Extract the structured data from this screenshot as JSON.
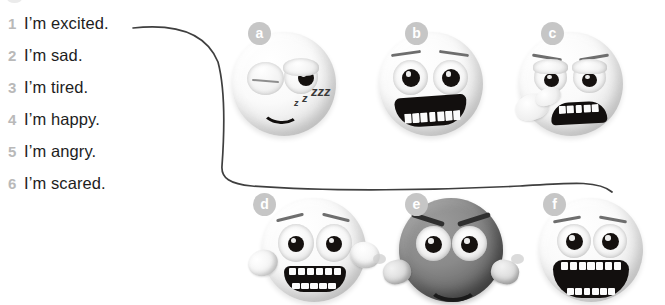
{
  "exercise": {
    "list": [
      {
        "num": "1",
        "text": "I’m excited."
      },
      {
        "num": "2",
        "text": "I’m sad."
      },
      {
        "num": "3",
        "text": "I’m tired."
      },
      {
        "num": "4",
        "text": "I’m happy."
      },
      {
        "num": "5",
        "text": "I’m angry."
      },
      {
        "num": "6",
        "text": "I’m scared."
      }
    ],
    "faces": [
      {
        "badge": "a",
        "emotion": "tired",
        "icon": "sleepy-face-icon",
        "extra": "zzz"
      },
      {
        "badge": "b",
        "emotion": "happy",
        "icon": "grinning-face-icon",
        "extra": ""
      },
      {
        "badge": "c",
        "emotion": "sad",
        "icon": "crying-face-icon",
        "extra": "tissue"
      },
      {
        "badge": "d",
        "emotion": "scared",
        "icon": "fearful-face-icon",
        "extra": "hands"
      },
      {
        "badge": "e",
        "emotion": "angry",
        "icon": "angry-face-icon",
        "extra": "fists"
      },
      {
        "badge": "f",
        "emotion": "excited",
        "icon": "excited-face-icon",
        "extra": ""
      }
    ],
    "connections": [
      {
        "from": "1",
        "to": "f"
      }
    ],
    "colors": {
      "number": "#b9b9b9",
      "text": "#1d1d1d",
      "badge_bg": "#c6c6c6",
      "badge_text": "#ffffff",
      "connector_line": "#3f3f3f"
    }
  }
}
